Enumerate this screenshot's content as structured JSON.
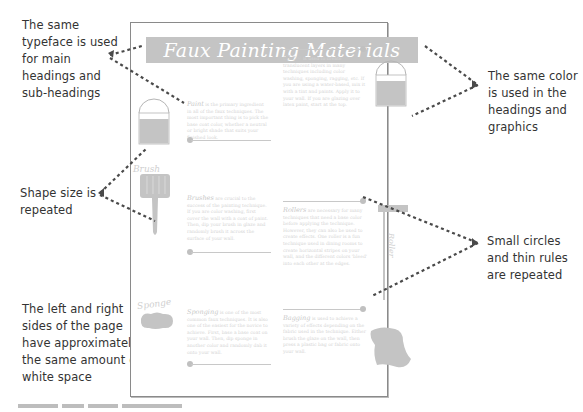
{
  "callouts": {
    "typeface": "The same\ntypeface is used\nfor main\nheadings and\nsub-headings",
    "color": "The same color\nis used in the\nheadings and\ngraphics",
    "shape_size": "Shape size is\nrepeated",
    "circles_rules": "Small circles\nand thin rules\nare repeated",
    "white_space": "The left and right\nsides of the page\nhave approximately\nthe same amount of\nwhite space"
  },
  "page": {
    "title": "Faux Painting Materials",
    "sections": [
      {
        "heading": "Paint",
        "body": "is the primary ingredient in all of the faux techniques. The most important thing is to pick the base coat color, whether a neutral or bright shade that suits your finished look."
      },
      {
        "heading": "Glaze",
        "body": "is used to create translucent layers in many techniques including color washing, sponging, ragging, etc. If you are using a water-based, mix it with a tint and paints. Apply it to your wall. If you are glazing over latex paint, start at the top."
      },
      {
        "heading": "Brushes",
        "body": "are crucial to the success of the painting technique. If you are color washing, first cover the wall with a coat of paint. Then, dip your brush in glaze and randomly brush it across the surface of your wall."
      },
      {
        "heading": "Rollers",
        "body": "are necessary for many techniques that need a base color before applying the technique. However, they can also be used to create effects. One roller is a fun technique used in dining rooms to create horizontal stripes on your wall, and the different colors 'bleed' into each other at the edges."
      },
      {
        "heading": "Sponging",
        "body": "is one of the most common faux techniques. It is also one of the easiest for the novice to achieve. First, base a base coat on your wall. Then, dip sponge in another color and randomly dab it onto your wall."
      },
      {
        "heading": "Bagging",
        "body": "is used to achieve a variety of effects depending on the fabric used in the technique. Either brush the glaze on the wall, then press a plastic bag or fabric onto your wall."
      }
    ],
    "graphic_labels": {
      "brush": "Brush",
      "sponge": "Sponge",
      "roller": "Roller"
    }
  },
  "colors": {
    "accent_gray": "#c4c4c4",
    "leader_dots": "#4a4a4a",
    "frame": "#8a8a8a"
  }
}
